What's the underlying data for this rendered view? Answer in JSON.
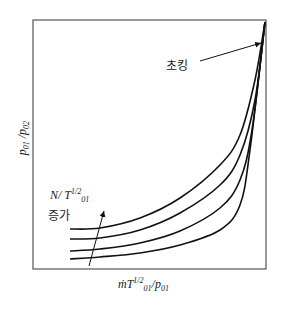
{
  "chart_data": {
    "type": "line",
    "title": "",
    "xlabel": "ṁT01^1/2/p01",
    "ylabel": "p01 / p02",
    "grid": false,
    "legend": null,
    "annotations": [
      {
        "text": "초킹",
        "meaning": "choking",
        "arrow_to": "converging point at upper right"
      },
      {
        "text": "N/T01^1/2 증가",
        "meaning": "increasing N/T01^1/2",
        "arrow_direction": "upward across curves"
      }
    ],
    "series": [
      {
        "name": "curve 1 (highest N/T01^1/2)",
        "points_px": [
          [
            70,
            229
          ],
          [
            100,
            228
          ],
          [
            140,
            218
          ],
          [
            180,
            198
          ],
          [
            220,
            165
          ],
          [
            240,
            135
          ],
          [
            255,
            80
          ],
          [
            265,
            22
          ]
        ]
      },
      {
        "name": "curve 2",
        "points_px": [
          [
            70,
            239
          ],
          [
            100,
            238
          ],
          [
            140,
            230
          ],
          [
            180,
            213
          ],
          [
            220,
            185
          ],
          [
            240,
            155
          ],
          [
            255,
            100
          ],
          [
            265,
            22
          ]
        ]
      },
      {
        "name": "curve 3",
        "points_px": [
          [
            70,
            251
          ],
          [
            100,
            249
          ],
          [
            140,
            243
          ],
          [
            180,
            231
          ],
          [
            220,
            208
          ],
          [
            240,
            180
          ],
          [
            252,
            130
          ],
          [
            265,
            22
          ]
        ]
      },
      {
        "name": "curve 4 (lowest N/T01^1/2)",
        "points_px": [
          [
            70,
            259
          ],
          [
            100,
            257
          ],
          [
            140,
            253
          ],
          [
            180,
            245
          ],
          [
            220,
            230
          ],
          [
            240,
            205
          ],
          [
            250,
            150
          ],
          [
            265,
            22
          ]
        ]
      }
    ]
  },
  "labels": {
    "y_main": "p",
    "y_sub1": "01",
    "y_sep": " /",
    "y_main2": "p",
    "y_sub2": "02",
    "x_m": "ṁT",
    "x_sup": "1/2",
    "x_sub": "01",
    "x_sep": "/p",
    "x_sub2": "01",
    "choke": "초킹",
    "n_main": "N/ T",
    "n_sup": "1/2",
    "n_sub": "01",
    "increase": "증가"
  },
  "colors": {
    "line": "#111111",
    "frame": "#555555"
  }
}
